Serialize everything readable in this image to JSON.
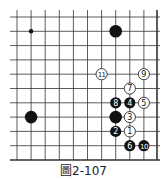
{
  "diagram": {
    "caption": "圖2-107",
    "grid": {
      "cols": 11,
      "rows": 11,
      "x_positions": [
        17,
        31.1,
        45.2,
        59.3,
        73.4,
        87.5,
        101.6,
        115.7,
        129.8,
        143.9,
        157
      ],
      "y_positions": [
        17,
        31.3,
        45.6,
        59.9,
        74.2,
        88.5,
        102.8,
        117.1,
        131.4,
        145.7,
        160
      ],
      "line_start": 10,
      "right_edge_col": 10,
      "bottom_edge_row": 10,
      "line_color": "#333333"
    },
    "star_points": [
      {
        "col": 1,
        "row": 1
      }
    ],
    "stones": [
      {
        "color": "black",
        "col": 7,
        "row": 1,
        "label": ""
      },
      {
        "color": "black",
        "col": 1,
        "row": 7,
        "label": ""
      },
      {
        "color": "black",
        "col": 7,
        "row": 7,
        "label": ""
      },
      {
        "color": "white",
        "col": 8,
        "row": 8,
        "label": "1"
      },
      {
        "color": "black",
        "col": 7,
        "row": 8,
        "label": "2"
      },
      {
        "color": "white",
        "col": 8,
        "row": 7,
        "label": "3"
      },
      {
        "color": "black",
        "col": 8,
        "row": 6,
        "label": "4"
      },
      {
        "color": "white",
        "col": 9,
        "row": 6,
        "label": "5"
      },
      {
        "color": "black",
        "col": 8,
        "row": 9,
        "label": "6"
      },
      {
        "color": "white",
        "col": 8,
        "row": 5,
        "label": "7"
      },
      {
        "color": "black",
        "col": 7,
        "row": 6,
        "label": "8"
      },
      {
        "color": "white",
        "col": 9,
        "row": 4,
        "label": "9"
      },
      {
        "color": "black",
        "col": 9,
        "row": 9,
        "label": "10"
      },
      {
        "color": "white",
        "col": 6,
        "row": 4,
        "label": "11"
      }
    ]
  }
}
